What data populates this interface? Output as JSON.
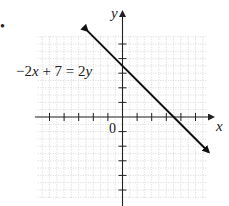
{
  "bullet": "•",
  "chart_data": {
    "type": "line",
    "title": "",
    "equation_label": "−2x + 7 = 2y",
    "xlabel": "x",
    "ylabel": "y",
    "origin_label": "0",
    "xlim": [
      -6,
      6
    ],
    "ylim": [
      -6,
      6
    ],
    "grid": true,
    "x_ticks": [
      -5,
      -4,
      -3,
      -2,
      -1,
      1,
      2,
      3,
      4,
      5
    ],
    "y_ticks": [
      -5,
      -4,
      -3,
      -2,
      -1,
      1,
      2,
      3,
      4,
      5
    ],
    "series": [
      {
        "name": "−2x + 7 = 2y",
        "slope": -1,
        "y_intercept": 3.5,
        "x_intercept": 3.5,
        "x": [
          -2.4,
          5.9
        ],
        "y": [
          5.9,
          -2.4
        ],
        "arrows": "both"
      }
    ]
  },
  "colors": {
    "line": "#111111",
    "axis": "#222222",
    "grid": "#bdbdbd",
    "text": "#222222"
  }
}
